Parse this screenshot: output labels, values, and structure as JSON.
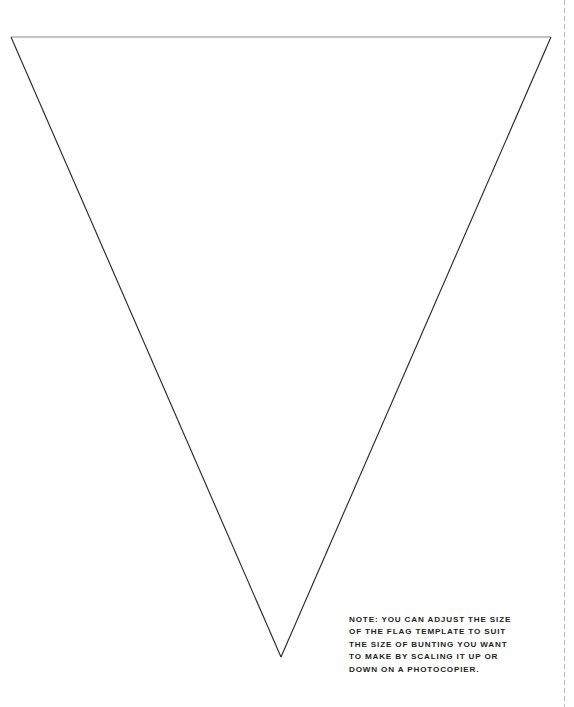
{
  "page": {
    "width": 574,
    "height": 707,
    "background_color": "#fefefe"
  },
  "template_shape": {
    "name": "triangular-bunting-flag",
    "type": "triangle",
    "stroke_color_edges": "#2b2b2b",
    "stroke_color_top": "#8c8c8c",
    "stroke_width": 1,
    "fill": "none",
    "vertices": [
      {
        "label": "top-left",
        "x": 11,
        "y": 37
      },
      {
        "label": "top-right",
        "x": 551,
        "y": 37
      },
      {
        "label": "bottom-apex",
        "x": 281,
        "y": 657
      }
    ]
  },
  "cut_guide": {
    "name": "dashed-cut-line",
    "orientation": "vertical",
    "x": 564,
    "color": "#bfbfbf",
    "dash_on": 5,
    "dash_off": 3,
    "width": 1
  },
  "note": {
    "lines": [
      "NOTE: YOU CAN ADJUST THE SIZE",
      "OF THE FLAG TEMPLATE TO SUIT",
      "THE SIZE OF BUNTING YOU WANT",
      "TO MAKE BY SCALING IT UP OR",
      "DOWN ON A PHOTOCOPIER."
    ],
    "color": "#231f20"
  }
}
